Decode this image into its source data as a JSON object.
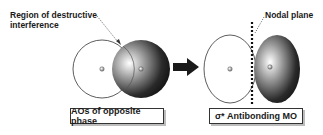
{
  "callouts": {
    "destructive_line1": "Region of destructive",
    "destructive_line2": "interference",
    "nodal_plane": "Nodal plane"
  },
  "captions": {
    "left": "AOs of opposite phase",
    "right": "σ* Antibonding MO"
  },
  "colors": {
    "outline": "#333333",
    "dark_lobe": "#1a1a1a",
    "shadow": "#bdbdbd"
  }
}
